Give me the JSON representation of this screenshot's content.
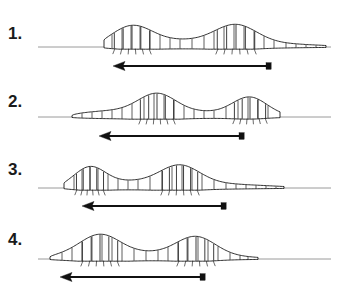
{
  "figure": {
    "title": "",
    "caption": "",
    "width": 339,
    "height": 293,
    "background_color": "#ffffff",
    "line_color": "#1a1a1a",
    "ground_line_color": "#9a9a9a",
    "arrow_color": "#111111"
  },
  "panels": [
    {
      "label": "1.",
      "label_x": 8,
      "label_y": 24,
      "ground": {
        "y": 47,
        "x1": 38,
        "x2": 331
      },
      "arrow": {
        "y": 66,
        "x_tail": 270,
        "x_head": 113
      },
      "larva": {
        "y_base": 47,
        "head_x": 104,
        "tail_x": 326,
        "bulges": [
          {
            "cx": 132,
            "rx": 34,
            "ry": 16,
            "striations": 5,
            "bristles": 6
          },
          {
            "cx": 236,
            "rx": 36,
            "ry": 17,
            "striations": 5,
            "bristles": 6
          }
        ],
        "segment_lines": [
          112,
          122,
          131,
          140,
          150,
          160,
          170,
          180,
          192,
          204,
          214,
          224,
          234,
          244,
          254,
          264,
          274,
          286,
          296,
          306,
          316
        ]
      }
    },
    {
      "label": "2.",
      "label_x": 8,
      "label_y": 92,
      "ground": {
        "y": 117,
        "x1": 38,
        "x2": 331
      },
      "arrow": {
        "y": 136,
        "x_tail": 243,
        "x_head": 99
      },
      "larva": {
        "y_base": 117,
        "head_x": 72,
        "tail_x": 280,
        "bulges": [
          {
            "cx": 157,
            "rx": 32,
            "ry": 17,
            "striations": 5,
            "bristles": 6
          },
          {
            "cx": 250,
            "rx": 30,
            "ry": 17,
            "striations": 5,
            "bristles": 6
          }
        ],
        "segment_lines": [
          82,
          92,
          102,
          112,
          122,
          132,
          144,
          154,
          164,
          174,
          184,
          194,
          204,
          214,
          226,
          238,
          248,
          258,
          268
        ]
      }
    },
    {
      "label": "3.",
      "label_x": 8,
      "label_y": 160,
      "ground": {
        "y": 188,
        "x1": 38,
        "x2": 331
      },
      "arrow": {
        "y": 206,
        "x_tail": 225,
        "x_head": 82
      },
      "larva": {
        "y_base": 188,
        "head_x": 64,
        "tail_x": 284,
        "bulges": [
          {
            "cx": 90,
            "rx": 26,
            "ry": 16,
            "striations": 5,
            "bristles": 6
          },
          {
            "cx": 180,
            "rx": 34,
            "ry": 17,
            "striations": 6,
            "bristles": 6
          }
        ],
        "segment_lines": [
          74,
          82,
          90,
          98,
          108,
          118,
          128,
          138,
          150,
          162,
          172,
          182,
          192,
          202,
          214,
          226,
          236,
          246,
          256,
          266,
          276
        ]
      }
    },
    {
      "label": "4.",
      "label_x": 8,
      "label_y": 230,
      "ground": {
        "y": 259,
        "x1": 38,
        "x2": 331
      },
      "arrow": {
        "y": 277,
        "x_tail": 204,
        "x_head": 60
      },
      "larva": {
        "y_base": 259,
        "head_x": 50,
        "tail_x": 258,
        "bulges": [
          {
            "cx": 100,
            "rx": 34,
            "ry": 18,
            "striations": 5,
            "bristles": 6
          },
          {
            "cx": 196,
            "rx": 34,
            "ry": 18,
            "striations": 5,
            "bristles": 6
          }
        ],
        "segment_lines": [
          62,
          72,
          82,
          92,
          102,
          112,
          122,
          134,
          146,
          158,
          168,
          178,
          188,
          198,
          208,
          218,
          230,
          240,
          248
        ]
      }
    }
  ]
}
